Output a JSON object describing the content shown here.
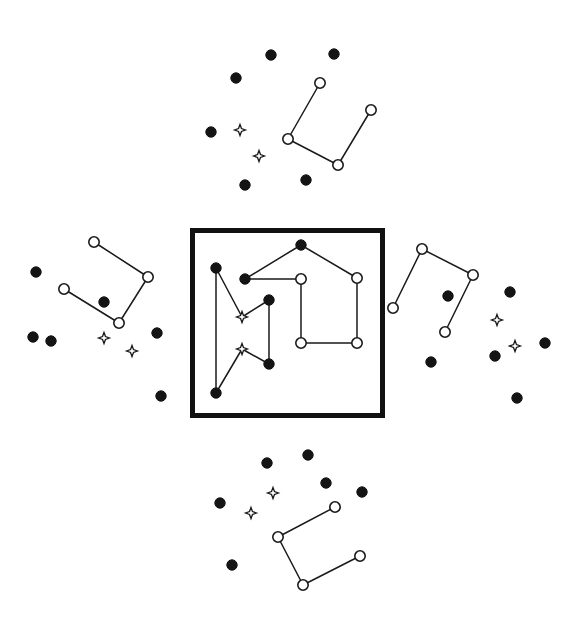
{
  "figure": {
    "canvas": {
      "width": 581,
      "height": 622,
      "background": "#ffffff"
    },
    "legend": {
      "filled_circle": "filled-dot-star",
      "open_circle": "open-circle-star",
      "four_point_star": "four-point-star-marker"
    },
    "colors": {
      "ink": "#1a1a1a",
      "fill_dark": "#141414",
      "paper": "#ffffff",
      "frame": "#111111"
    },
    "frame": {
      "x": 190,
      "y": 228,
      "width": 195,
      "height": 190,
      "stroke_width": 5
    },
    "marker_sizes": {
      "filled_radius": 5.2,
      "open_radius": 5.2,
      "star_radius": 5.5
    }
  },
  "panels": [
    {
      "name": "center-panel",
      "boxed": true,
      "open_circles": [
        {
          "id": "c-o1",
          "x": 301,
          "y": 279
        },
        {
          "id": "c-o2",
          "x": 357,
          "y": 278
        },
        {
          "id": "c-o3",
          "x": 301,
          "y": 343
        },
        {
          "id": "c-o4",
          "x": 357,
          "y": 343
        }
      ],
      "filled_circles": [
        {
          "id": "c-f1",
          "x": 301,
          "y": 245
        },
        {
          "id": "c-f2",
          "x": 245,
          "y": 279
        },
        {
          "id": "c-f3",
          "x": 216,
          "y": 268
        },
        {
          "id": "c-f4",
          "x": 269,
          "y": 300
        },
        {
          "id": "c-f5",
          "x": 269,
          "y": 364
        },
        {
          "id": "c-f6",
          "x": 216,
          "y": 393
        }
      ],
      "stars": [
        {
          "id": "c-s1",
          "x": 242,
          "y": 317
        },
        {
          "id": "c-s2",
          "x": 242,
          "y": 349
        }
      ],
      "edges": [
        {
          "from": [
            301,
            245
          ],
          "to": [
            245,
            279
          ]
        },
        {
          "from": [
            301,
            245
          ],
          "to": [
            357,
            278
          ]
        },
        {
          "from": [
            245,
            279
          ],
          "to": [
            301,
            279
          ]
        },
        {
          "from": [
            301,
            279
          ],
          "to": [
            301,
            343
          ]
        },
        {
          "from": [
            301,
            343
          ],
          "to": [
            357,
            343
          ]
        },
        {
          "from": [
            357,
            343
          ],
          "to": [
            357,
            278
          ]
        },
        {
          "from": [
            216,
            268
          ],
          "to": [
            216,
            393
          ]
        },
        {
          "from": [
            216,
            268
          ],
          "to": [
            242,
            317
          ]
        },
        {
          "from": [
            242,
            317
          ],
          "to": [
            269,
            300
          ]
        },
        {
          "from": [
            269,
            300
          ],
          "to": [
            269,
            364
          ]
        },
        {
          "from": [
            269,
            364
          ],
          "to": [
            242,
            349
          ]
        },
        {
          "from": [
            242,
            349
          ],
          "to": [
            216,
            393
          ]
        }
      ]
    },
    {
      "name": "top-panel",
      "boxed": false,
      "open_circles": [
        {
          "id": "t-o1",
          "x": 320,
          "y": 83
        },
        {
          "id": "t-o2",
          "x": 288,
          "y": 139
        },
        {
          "id": "t-o3",
          "x": 338,
          "y": 165
        },
        {
          "id": "t-o4",
          "x": 371,
          "y": 110
        }
      ],
      "filled_circles": [
        {
          "id": "t-f1",
          "x": 271,
          "y": 55
        },
        {
          "id": "t-f2",
          "x": 334,
          "y": 54
        },
        {
          "id": "t-f3",
          "x": 236,
          "y": 78
        },
        {
          "id": "t-f4",
          "x": 211,
          "y": 132
        },
        {
          "id": "t-f5",
          "x": 245,
          "y": 185
        },
        {
          "id": "t-f6",
          "x": 306,
          "y": 180
        }
      ],
      "stars": [
        {
          "id": "t-s1",
          "x": 240,
          "y": 130
        },
        {
          "id": "t-s2",
          "x": 259,
          "y": 156
        }
      ],
      "edges": [
        {
          "from": [
            320,
            83
          ],
          "to": [
            288,
            139
          ]
        },
        {
          "from": [
            288,
            139
          ],
          "to": [
            338,
            165
          ]
        },
        {
          "from": [
            338,
            165
          ],
          "to": [
            371,
            110
          ]
        }
      ]
    },
    {
      "name": "left-panel",
      "boxed": false,
      "open_circles": [
        {
          "id": "l-o1",
          "x": 94,
          "y": 242
        },
        {
          "id": "l-o2",
          "x": 148,
          "y": 277
        },
        {
          "id": "l-o3",
          "x": 119,
          "y": 323
        },
        {
          "id": "l-o4",
          "x": 64,
          "y": 289
        }
      ],
      "filled_circles": [
        {
          "id": "l-f1",
          "x": 36,
          "y": 272
        },
        {
          "id": "l-f2",
          "x": 104,
          "y": 302
        },
        {
          "id": "l-f3",
          "x": 33,
          "y": 337
        },
        {
          "id": "l-f4",
          "x": 51,
          "y": 341
        },
        {
          "id": "l-f5",
          "x": 157,
          "y": 333
        },
        {
          "id": "l-f6",
          "x": 161,
          "y": 396
        }
      ],
      "stars": [
        {
          "id": "l-s1",
          "x": 104,
          "y": 338
        },
        {
          "id": "l-s2",
          "x": 132,
          "y": 351
        }
      ],
      "edges": [
        {
          "from": [
            94,
            242
          ],
          "to": [
            148,
            277
          ]
        },
        {
          "from": [
            148,
            277
          ],
          "to": [
            119,
            323
          ]
        },
        {
          "from": [
            119,
            323
          ],
          "to": [
            64,
            289
          ]
        }
      ]
    },
    {
      "name": "right-panel",
      "boxed": false,
      "open_circles": [
        {
          "id": "r-o1",
          "x": 422,
          "y": 249
        },
        {
          "id": "r-o2",
          "x": 473,
          "y": 275
        },
        {
          "id": "r-o3",
          "x": 445,
          "y": 332
        },
        {
          "id": "r-o4",
          "x": 393,
          "y": 308
        }
      ],
      "filled_circles": [
        {
          "id": "r-f1",
          "x": 448,
          "y": 296
        },
        {
          "id": "r-f2",
          "x": 510,
          "y": 292
        },
        {
          "id": "r-f3",
          "x": 545,
          "y": 343
        },
        {
          "id": "r-f4",
          "x": 495,
          "y": 356
        },
        {
          "id": "r-f5",
          "x": 431,
          "y": 362
        },
        {
          "id": "r-f6",
          "x": 517,
          "y": 398
        }
      ],
      "stars": [
        {
          "id": "r-s1",
          "x": 497,
          "y": 320
        },
        {
          "id": "r-s2",
          "x": 515,
          "y": 346
        }
      ],
      "edges": [
        {
          "from": [
            422,
            249
          ],
          "to": [
            473,
            275
          ]
        },
        {
          "from": [
            473,
            275
          ],
          "to": [
            445,
            332
          ]
        },
        {
          "from": [
            422,
            249
          ],
          "to": [
            393,
            308
          ]
        }
      ]
    },
    {
      "name": "bottom-panel",
      "boxed": false,
      "open_circles": [
        {
          "id": "b-o1",
          "x": 335,
          "y": 507
        },
        {
          "id": "b-o2",
          "x": 278,
          "y": 537
        },
        {
          "id": "b-o3",
          "x": 303,
          "y": 585
        },
        {
          "id": "b-o4",
          "x": 360,
          "y": 556
        }
      ],
      "filled_circles": [
        {
          "id": "b-f1",
          "x": 267,
          "y": 463
        },
        {
          "id": "b-f2",
          "x": 308,
          "y": 455
        },
        {
          "id": "b-f3",
          "x": 326,
          "y": 483
        },
        {
          "id": "b-f4",
          "x": 362,
          "y": 492
        },
        {
          "id": "b-f5",
          "x": 220,
          "y": 503
        },
        {
          "id": "b-f6",
          "x": 232,
          "y": 565
        }
      ],
      "stars": [
        {
          "id": "b-s1",
          "x": 273,
          "y": 493
        },
        {
          "id": "b-s2",
          "x": 251,
          "y": 513
        }
      ],
      "edges": [
        {
          "from": [
            335,
            507
          ],
          "to": [
            278,
            537
          ]
        },
        {
          "from": [
            278,
            537
          ],
          "to": [
            303,
            585
          ]
        },
        {
          "from": [
            303,
            585
          ],
          "to": [
            360,
            556
          ]
        }
      ]
    }
  ]
}
